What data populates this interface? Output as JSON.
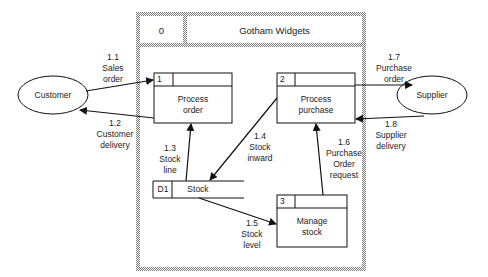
{
  "system": {
    "id": "0",
    "title": "Gotham Widgets"
  },
  "external_entities": [
    {
      "name": "Customer"
    },
    {
      "name": "Supplier"
    }
  ],
  "processes": [
    {
      "id": "1",
      "name": "Process\norder"
    },
    {
      "id": "2",
      "name": "Process\npurchase"
    },
    {
      "id": "3",
      "name": "Manage\nstock"
    }
  ],
  "data_store": {
    "id": "D1",
    "name": "Stock"
  },
  "flows": [
    {
      "id": "1.1",
      "label": "1.1\nSales\norder"
    },
    {
      "id": "1.2",
      "label": "1.2\nCustomer\ndelivery"
    },
    {
      "id": "1.3",
      "label": "1.3\nStock\nline"
    },
    {
      "id": "1.4",
      "label": "1.4\nStock\ninward"
    },
    {
      "id": "1.5",
      "label": "1.5\nStock\nlevel"
    },
    {
      "id": "1.6",
      "label": "1.6\nPurchase\nOrder\nrequest"
    },
    {
      "id": "1.7",
      "label": "1.7\nPurchase\norder"
    },
    {
      "id": "1.8",
      "label": "1.8\nSupplier\ndelivery"
    }
  ]
}
